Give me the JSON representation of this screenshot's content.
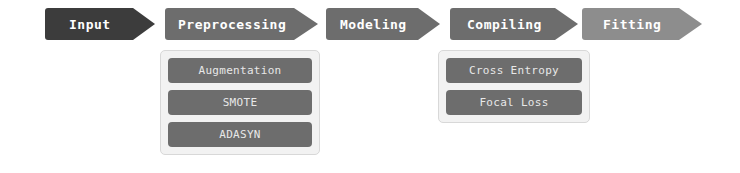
{
  "diagram": {
    "type": "pipeline-flowchart",
    "background_color": "#ffffff",
    "stages": [
      {
        "id": "input",
        "label": "Input",
        "color": "#3c3c3c",
        "text_color": "#ffffff",
        "x": 45,
        "y": 8,
        "width": 110,
        "height": 32,
        "head_width": 22,
        "options": []
      },
      {
        "id": "preprocessing",
        "label": "Preprocessing",
        "color": "#6d6d6d",
        "text_color": "#ffffff",
        "x": 165,
        "y": 8,
        "width": 153,
        "height": 32,
        "head_width": 24,
        "options": [
          "Augmentation",
          "SMOTE",
          "ADASYN"
        ]
      },
      {
        "id": "modeling",
        "label": "Modeling",
        "color": "#6d6d6d",
        "text_color": "#ffffff",
        "x": 326,
        "y": 8,
        "width": 114,
        "height": 32,
        "head_width": 22,
        "options": []
      },
      {
        "id": "compiling",
        "label": "Compiling",
        "color": "#6d6d6d",
        "text_color": "#ffffff",
        "x": 450,
        "y": 8,
        "width": 128,
        "height": 32,
        "head_width": 23,
        "options": [
          "Cross Entropy",
          "Focal Loss"
        ]
      },
      {
        "id": "fitting",
        "label": "Fitting",
        "color": "#8d8d8d",
        "text_color": "#ffffff",
        "x": 582,
        "y": 8,
        "width": 120,
        "height": 32,
        "head_width": 23,
        "options": []
      }
    ],
    "panels": [
      {
        "id": "preprocessing-options",
        "stage": "preprocessing",
        "x": 160,
        "y": 50,
        "width": 160,
        "height": 105,
        "background_color": "#f2f2f2",
        "border_color": "#d8d8d8",
        "item_color": "#6d6d6d",
        "item_text_color": "#e8e8e8",
        "items": [
          {
            "id": "augmentation",
            "label": "Augmentation"
          },
          {
            "id": "smote",
            "label": "SMOTE"
          },
          {
            "id": "adasyn",
            "label": "ADASYN"
          }
        ]
      },
      {
        "id": "compiling-options",
        "stage": "compiling",
        "x": 438,
        "y": 50,
        "width": 152,
        "height": 73,
        "background_color": "#f2f2f2",
        "border_color": "#d8d8d8",
        "item_color": "#6d6d6d",
        "item_text_color": "#e8e8e8",
        "items": [
          {
            "id": "cross-entropy",
            "label": "Cross Entropy"
          },
          {
            "id": "focal-loss",
            "label": "Focal Loss"
          }
        ]
      }
    ]
  }
}
